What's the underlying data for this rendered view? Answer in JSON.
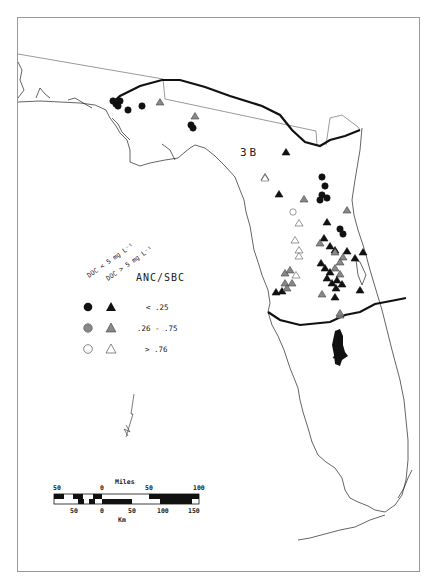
{
  "map": {
    "region_label": "3B",
    "colors": {
      "black": "#111111",
      "gray": "#888888",
      "open": "#ffffff",
      "line": "#222222",
      "frame": "#999999"
    }
  },
  "legend": {
    "col_header_circle": "DOC < 5 mg L⁻¹",
    "col_header_triangle": "DOC > 5 mg L⁻¹",
    "title": "ANC/SBC",
    "rows": [
      {
        "label": "< .25",
        "fill": "black"
      },
      {
        "label": ".26 - .75",
        "fill": "gray"
      },
      {
        "label": "> .76",
        "fill": "open"
      }
    ]
  },
  "scale_bar": {
    "miles_title": "Miles",
    "miles_ticks": [
      "50",
      "0",
      "50",
      "100"
    ],
    "km_title": "Km",
    "km_ticks": [
      "50",
      "0",
      "50",
      "100",
      "150"
    ]
  },
  "sites": {
    "circles": [
      {
        "x": 116,
        "y": 104,
        "f": "black"
      },
      {
        "x": 120,
        "y": 101,
        "f": "black"
      },
      {
        "x": 113,
        "y": 101,
        "f": "black"
      },
      {
        "x": 118,
        "y": 106,
        "f": "black"
      },
      {
        "x": 128,
        "y": 110,
        "f": "black"
      },
      {
        "x": 142,
        "y": 106,
        "f": "black"
      },
      {
        "x": 191,
        "y": 125,
        "f": "black"
      },
      {
        "x": 193,
        "y": 128,
        "f": "black"
      },
      {
        "x": 322,
        "y": 177,
        "f": "black"
      },
      {
        "x": 325,
        "y": 186,
        "f": "black"
      },
      {
        "x": 322,
        "y": 195,
        "f": "black"
      },
      {
        "x": 327,
        "y": 198,
        "f": "black"
      },
      {
        "x": 320,
        "y": 200,
        "f": "black"
      },
      {
        "x": 340,
        "y": 229,
        "f": "black"
      },
      {
        "x": 343,
        "y": 234,
        "f": "black"
      },
      {
        "x": 293,
        "y": 212,
        "f": "open"
      }
    ],
    "triangles": [
      {
        "x": 160,
        "y": 102,
        "f": "gray"
      },
      {
        "x": 195,
        "y": 116,
        "f": "gray"
      },
      {
        "x": 286,
        "y": 152,
        "f": "black"
      },
      {
        "x": 265,
        "y": 177,
        "f": "gray"
      },
      {
        "x": 279,
        "y": 194,
        "f": "black"
      },
      {
        "x": 304,
        "y": 199,
        "f": "gray"
      },
      {
        "x": 265,
        "y": 178,
        "f": "open"
      },
      {
        "x": 299,
        "y": 223,
        "f": "open"
      },
      {
        "x": 295,
        "y": 240,
        "f": "open"
      },
      {
        "x": 299,
        "y": 250,
        "f": "open"
      },
      {
        "x": 299,
        "y": 256,
        "f": "open"
      },
      {
        "x": 347,
        "y": 210,
        "f": "gray"
      },
      {
        "x": 327,
        "y": 222,
        "f": "black"
      },
      {
        "x": 324,
        "y": 238,
        "f": "black"
      },
      {
        "x": 320,
        "y": 243,
        "f": "gray"
      },
      {
        "x": 330,
        "y": 246,
        "f": "black"
      },
      {
        "x": 335,
        "y": 250,
        "f": "black"
      },
      {
        "x": 335,
        "y": 252,
        "f": "gray"
      },
      {
        "x": 347,
        "y": 251,
        "f": "black"
      },
      {
        "x": 363,
        "y": 252,
        "f": "black"
      },
      {
        "x": 343,
        "y": 257,
        "f": "gray"
      },
      {
        "x": 355,
        "y": 258,
        "f": "black"
      },
      {
        "x": 340,
        "y": 262,
        "f": "gray"
      },
      {
        "x": 321,
        "y": 263,
        "f": "black"
      },
      {
        "x": 325,
        "y": 268,
        "f": "black"
      },
      {
        "x": 330,
        "y": 272,
        "f": "black"
      },
      {
        "x": 335,
        "y": 268,
        "f": "gray"
      },
      {
        "x": 340,
        "y": 274,
        "f": "gray"
      },
      {
        "x": 327,
        "y": 278,
        "f": "black"
      },
      {
        "x": 332,
        "y": 283,
        "f": "black"
      },
      {
        "x": 337,
        "y": 280,
        "f": "black"
      },
      {
        "x": 342,
        "y": 284,
        "f": "black"
      },
      {
        "x": 336,
        "y": 288,
        "f": "black"
      },
      {
        "x": 335,
        "y": 297,
        "f": "black"
      },
      {
        "x": 360,
        "y": 290,
        "f": "black"
      },
      {
        "x": 322,
        "y": 294,
        "f": "gray"
      },
      {
        "x": 285,
        "y": 273,
        "f": "gray"
      },
      {
        "x": 290,
        "y": 270,
        "f": "gray"
      },
      {
        "x": 296,
        "y": 275,
        "f": "open"
      },
      {
        "x": 292,
        "y": 283,
        "f": "gray"
      },
      {
        "x": 285,
        "y": 283,
        "f": "gray"
      },
      {
        "x": 276,
        "y": 292,
        "f": "black"
      },
      {
        "x": 282,
        "y": 291,
        "f": "black"
      },
      {
        "x": 287,
        "y": 288,
        "f": "gray"
      },
      {
        "x": 340,
        "y": 315,
        "f": "gray"
      },
      {
        "x": 340,
        "y": 313,
        "f": "gray"
      },
      {
        "x": 337,
        "y": 355,
        "f": "black"
      }
    ]
  }
}
